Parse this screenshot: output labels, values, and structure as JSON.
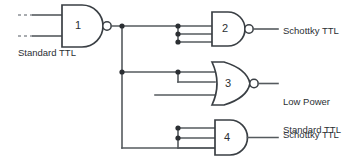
{
  "diagram": {
    "type": "logic-circuit",
    "colors": {
      "wire": "#555a5e",
      "gate_outline": "#3a3f44",
      "background": "#ffffff",
      "text": "#2b2f33"
    }
  },
  "gates": [
    {
      "id": "gate-1",
      "number": "1",
      "type": "NAND",
      "inputs": 2,
      "has_output_bubble": true,
      "family_label": "Standard TTL"
    },
    {
      "id": "gate-2",
      "number": "2",
      "type": "NAND",
      "inputs": 3,
      "has_output_bubble": true,
      "family_label": "Schottky TTL"
    },
    {
      "id": "gate-3",
      "number": "3",
      "type": "NOR",
      "inputs": 3,
      "has_output_bubble": true,
      "family_label": "Low Power\nSchottky TTL"
    },
    {
      "id": "gate-4",
      "number": "4",
      "type": "AND",
      "inputs": 3,
      "has_output_bubble": false,
      "family_label": "Standard TTL"
    }
  ],
  "labels": {
    "driver_family": "Standard TTL",
    "load_1_family": "Schottky TTL",
    "load_2_family_line1": "Low Power",
    "load_2_family_line2": "Schottky TTL",
    "load_3_family": "Standard TTL"
  },
  "gate_numbers": {
    "g1": "1",
    "g2": "2",
    "g3": "3",
    "g4": "4"
  }
}
